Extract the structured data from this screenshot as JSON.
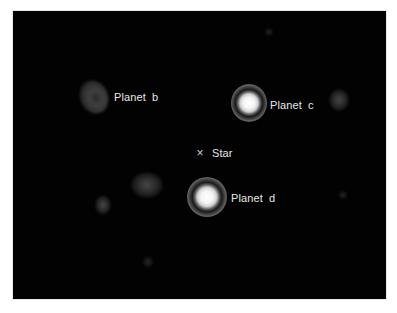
{
  "image": {
    "background_color": "#020202",
    "frame": {
      "x": 13,
      "y": 11,
      "width": 373,
      "height": 288
    }
  },
  "labels": {
    "planet_b": "Planet  b",
    "planet_c": "Planet  c",
    "planet_d": "Planet  d",
    "star": "Star"
  },
  "markers": {
    "star_marker": "×"
  },
  "objects": [
    {
      "name": "planet-b",
      "x": 94,
      "y": 97,
      "brightness": "faint"
    },
    {
      "name": "planet-c",
      "x": 249,
      "y": 103,
      "brightness": "bright"
    },
    {
      "name": "planet-d",
      "x": 207,
      "y": 197,
      "brightness": "bright"
    },
    {
      "name": "star",
      "x": 200,
      "y": 153,
      "brightness": "masked"
    }
  ]
}
